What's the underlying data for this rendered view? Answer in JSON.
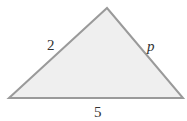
{
  "diagram": {
    "type": "triangle",
    "vertices": {
      "left": [
        9,
        98
      ],
      "top": [
        107,
        8
      ],
      "right": [
        183,
        98
      ]
    },
    "fill_color": "#efefef",
    "stroke_color": "#9a9a9a",
    "labels": {
      "left_side": "2",
      "right_side": "p",
      "base": "5"
    }
  }
}
